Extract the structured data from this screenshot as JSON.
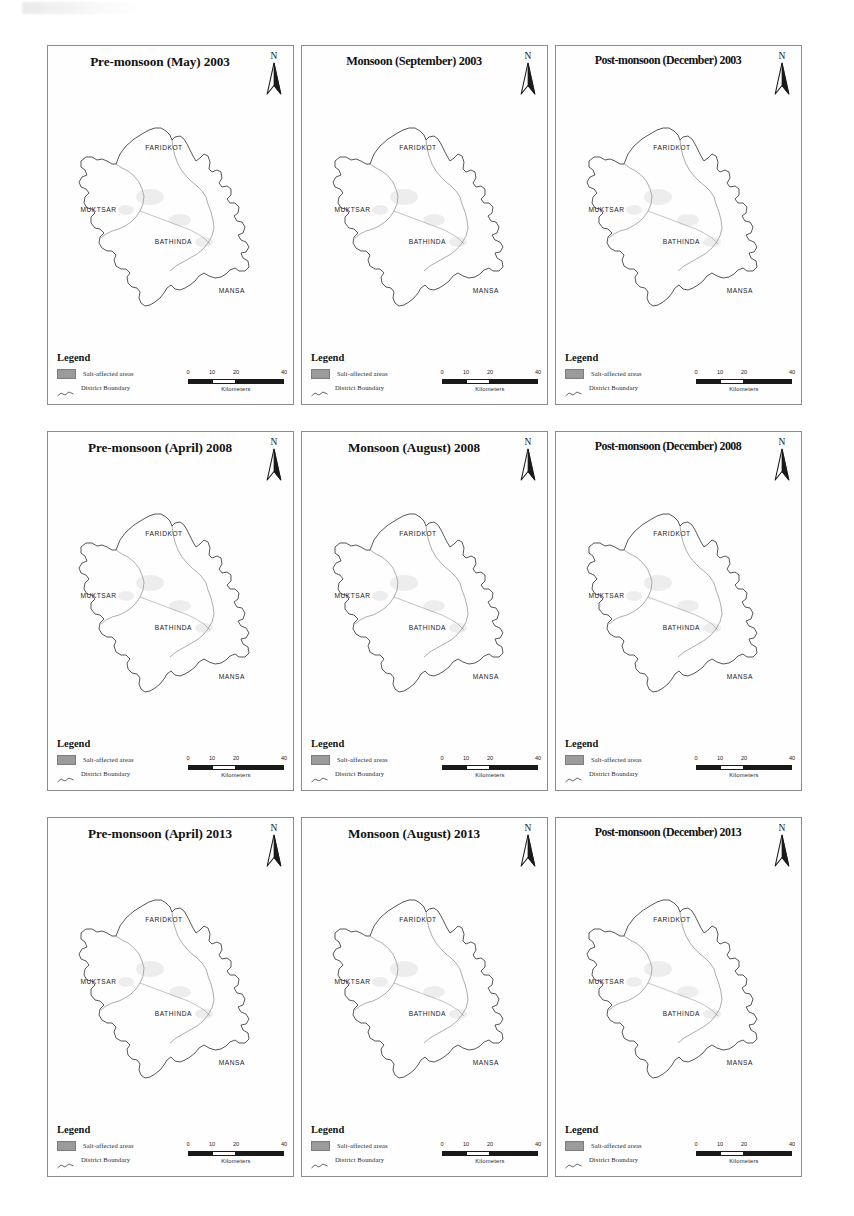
{
  "figure": {
    "rows": 3,
    "columns": 3,
    "background_color": "#ffffff",
    "panel_border_color": "#8c8c8c"
  },
  "common": {
    "north_label": "N",
    "legend_title": "Legend",
    "legend_items": [
      {
        "label": "Salt-affected areas",
        "symbol": "filled-square",
        "color": "#9b9b9b"
      },
      {
        "label": "District Boundary",
        "symbol": "line",
        "color": "#1a1a1a"
      }
    ],
    "districts": [
      {
        "name": "FARIDKOT",
        "x": 47,
        "y": 22
      },
      {
        "name": "MUKTSAR",
        "x": 19,
        "y": 47
      },
      {
        "name": "BATHINDA",
        "x": 51,
        "y": 60
      },
      {
        "name": "MANSA",
        "x": 76,
        "y": 80
      }
    ],
    "scalebar": {
      "ticks": [
        "0",
        "10",
        "20",
        "40"
      ],
      "tick_positions": [
        0,
        25,
        50,
        100
      ],
      "unit_label": "Kilometers"
    }
  },
  "panels": [
    {
      "id": "p1",
      "title": "Pre-monsoon (May) 2003",
      "season": "Pre-monsoon",
      "month": "May",
      "year": "2003",
      "title_size": "normal"
    },
    {
      "id": "p2",
      "title": "Monsoon (September) 2003",
      "season": "Monsoon",
      "month": "September",
      "year": "2003",
      "title_size": "long"
    },
    {
      "id": "p3",
      "title": "Post-monsoon (December) 2003",
      "season": "Post-monsoon",
      "month": "December",
      "year": "2003",
      "title_size": "xlong"
    },
    {
      "id": "p4",
      "title": "Pre-monsoon (April) 2008",
      "season": "Pre-monsoon",
      "month": "April",
      "year": "2008",
      "title_size": "normal"
    },
    {
      "id": "p5",
      "title": "Monsoon (August) 2008",
      "season": "Monsoon",
      "month": "August",
      "year": "2008",
      "title_size": "normal"
    },
    {
      "id": "p6",
      "title": "Post-monsoon (December) 2008",
      "season": "Post-monsoon",
      "month": "December",
      "year": "2008",
      "title_size": "xlong"
    },
    {
      "id": "p7",
      "title": "Pre-monsoon (April) 2013",
      "season": "Pre-monsoon",
      "month": "April",
      "year": "2013",
      "title_size": "normal"
    },
    {
      "id": "p8",
      "title": "Monsoon (August) 2013",
      "season": "Monsoon",
      "month": "August",
      "year": "2013",
      "title_size": "normal"
    },
    {
      "id": "p9",
      "title": "Post-monsoon (December) 2013",
      "season": "Post-monsoon",
      "month": "December",
      "year": "2013",
      "title_size": "xlong"
    }
  ]
}
